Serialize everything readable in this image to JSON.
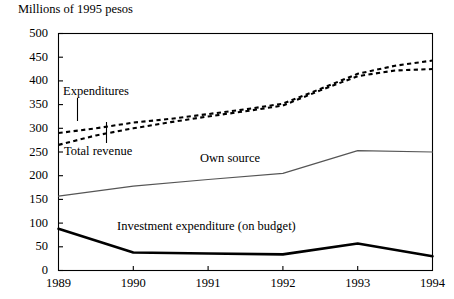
{
  "chart": {
    "axis_title": "Millions of 1995 pesos",
    "yticks": [
      0,
      50,
      100,
      150,
      200,
      250,
      300,
      350,
      400,
      450,
      500
    ],
    "xticks": [
      "1989",
      "1990",
      "1991",
      "1992",
      "1993",
      "1994"
    ],
    "labels": {
      "expenditures": "Expenditures",
      "total_revenue": "Total revenue",
      "own_source": "Own source",
      "investment": "Investment expenditure (on budget)"
    },
    "colors": {
      "axis": "#000000",
      "expenditures": "#000000",
      "total_revenue": "#000000",
      "own_source": "#555555",
      "investment": "#000000"
    }
  },
  "chart_data": {
    "type": "line",
    "title": "",
    "subtitle": "",
    "xlabel": "",
    "ylabel": "Millions of 1995 pesos",
    "x": [
      1989,
      1990,
      1991,
      1992,
      1993,
      1994
    ],
    "xlim": [
      1989,
      1994
    ],
    "ylim": [
      0,
      500
    ],
    "yticks": [
      0,
      50,
      100,
      150,
      200,
      250,
      300,
      350,
      400,
      450,
      500
    ],
    "xticks": [
      1989,
      1990,
      1991,
      1992,
      1993,
      1994
    ],
    "grid": false,
    "legend": "none (inline annotations)",
    "annotations": [
      {
        "text": "Expenditures",
        "points_to": "upper dashed series near 1989.3"
      },
      {
        "text": "Total revenue",
        "points_to": "lower dashed series near 1989.6"
      },
      {
        "text": "Own source",
        "points_to": "solid grey mid series"
      },
      {
        "text": "Investment expenditure (on budget)",
        "points_to": "thick black lower series"
      }
    ],
    "series": [
      {
        "name": "Expenditures",
        "style": "dashed",
        "color": "#000000",
        "values": [
          290,
          312,
          330,
          352,
          415,
          443
        ],
        "detail_x": [
          1989,
          1989.5,
          1990,
          1990.5,
          1991,
          1991.5,
          1992,
          1992.5,
          1993,
          1993.5,
          1994
        ],
        "detail_values": [
          290,
          300,
          312,
          320,
          330,
          340,
          352,
          383,
          415,
          432,
          443
        ]
      },
      {
        "name": "Total revenue",
        "style": "dashed",
        "color": "#000000",
        "values": [
          265,
          300,
          325,
          348,
          410,
          425
        ],
        "detail_x": [
          1989,
          1989.5,
          1990,
          1990.5,
          1991,
          1991.5,
          1992,
          1992.5,
          1993,
          1993.5,
          1994
        ],
        "detail_values": [
          265,
          285,
          300,
          313,
          325,
          336,
          348,
          380,
          410,
          422,
          425
        ]
      },
      {
        "name": "Own source",
        "style": "solid",
        "color": "#555555",
        "values": [
          157,
          178,
          192,
          205,
          253,
          250
        ]
      },
      {
        "name": "Investment expenditure (on budget)",
        "style": "solid-thick",
        "color": "#000000",
        "values": [
          88,
          38,
          36,
          34,
          57,
          30
        ]
      }
    ]
  }
}
